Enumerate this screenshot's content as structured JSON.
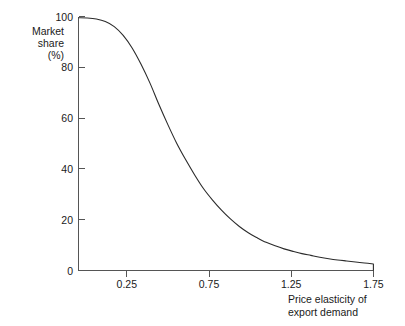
{
  "chart_data": {
    "type": "line",
    "title": "",
    "subtitle": "",
    "xlabel_lines": [
      "Price elasticity of",
      "export demand"
    ],
    "ylabel_lines": [
      "Market",
      "share",
      "(%)"
    ],
    "xlabel": "Price elasticity of export demand",
    "ylabel": "Market share (%)",
    "xlim": [
      0.1,
      1.75
    ],
    "ylim": [
      0,
      101
    ],
    "grid": false,
    "legend": null,
    "xticks": [
      0.25,
      0.75,
      1.25,
      1.75
    ],
    "xtick_labels": [
      "0.25",
      "0.75",
      "1.25",
      "1.75"
    ],
    "yticks": [
      0,
      20,
      40,
      60,
      80,
      100
    ],
    "ytick_labels": [
      "0",
      "20",
      "40",
      "60",
      "80",
      "100"
    ],
    "series": [
      {
        "name": "Market share",
        "x": [
          0.1,
          0.15,
          0.2,
          0.25,
          0.3,
          0.35,
          0.4,
          0.45,
          0.5,
          0.55,
          0.6,
          0.65,
          0.7,
          0.75,
          0.8,
          0.85,
          0.9,
          0.95,
          1.0,
          1.05,
          1.1,
          1.15,
          1.2,
          1.25,
          1.3,
          1.35,
          1.4,
          1.45,
          1.5,
          1.55,
          1.6,
          1.65,
          1.7,
          1.75
        ],
        "values": [
          100.5,
          100.4,
          100.0,
          99.0,
          97.0,
          93.5,
          88.5,
          82.0,
          74.5,
          66.0,
          58.0,
          50.5,
          44.0,
          38.0,
          32.5,
          28.0,
          24.0,
          20.5,
          17.5,
          15.0,
          13.0,
          11.2,
          9.8,
          8.6,
          7.6,
          6.7,
          6.0,
          5.3,
          4.7,
          4.2,
          3.8,
          3.4,
          3.0,
          2.6
        ]
      }
    ],
    "annotations": [
      {
        "text": "curve terminates with short vertical drop to axis at x = 1.75"
      }
    ],
    "colors": {
      "curve": "#2b2b2b",
      "axis": "#555555",
      "text": "#1a1a1a",
      "background": "#ffffff"
    }
  }
}
